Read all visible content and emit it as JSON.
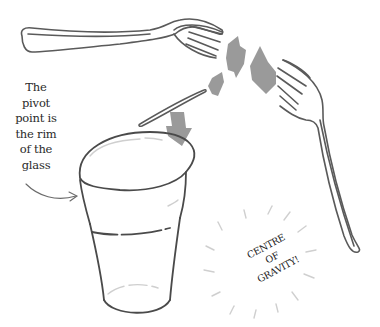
{
  "illustration": {
    "caption": {
      "lines": [
        "The",
        "pivot",
        "point is",
        "the rim",
        "of the",
        "glass"
      ]
    },
    "label": {
      "lines": [
        "CENTRE",
        "OF",
        "GRAVITY!"
      ]
    },
    "colors": {
      "line": "#5a5a5a",
      "arrow_fill": "#9a9a9a",
      "pale": "#cfcfcf",
      "text": "#2a2a2a"
    },
    "objects": [
      "fork-left",
      "fork-right",
      "toothpick",
      "glass",
      "arrows"
    ]
  }
}
